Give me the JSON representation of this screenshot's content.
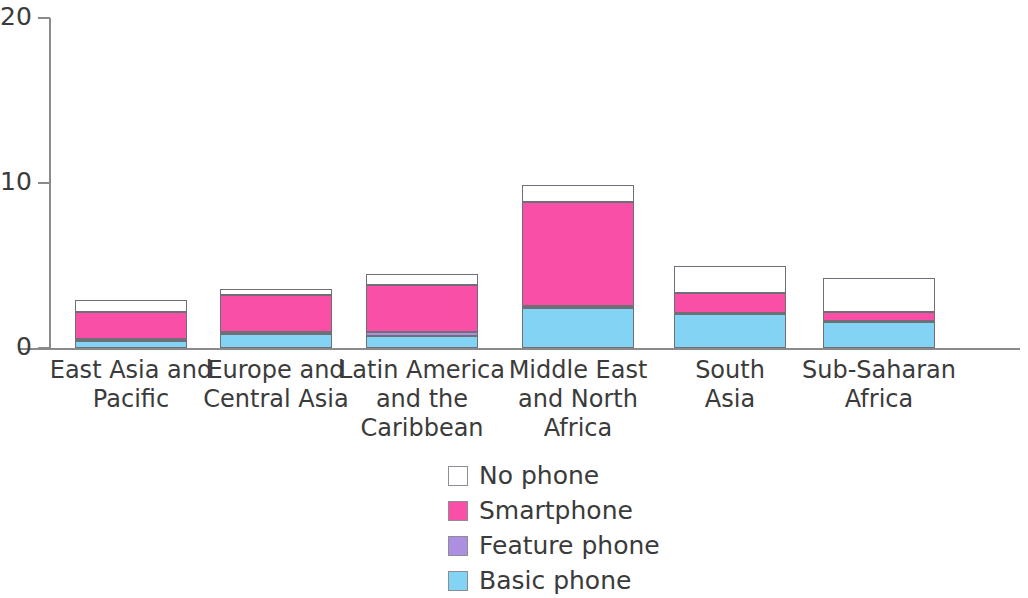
{
  "chart_data": {
    "type": "bar",
    "subtype": "stacked-bar",
    "title": "",
    "subtitle": "",
    "xlabel": "",
    "ylabel": "",
    "ylim": [
      0,
      20
    ],
    "ytick_labels": [
      "0",
      "10",
      "20"
    ],
    "ytick_values": [
      0,
      10,
      20
    ],
    "grid": false,
    "legend_position": "bottom-center",
    "categories": [
      "East Asia and\nPacific",
      "Europe and\nCentral Asia",
      "Latin America\nand the\nCaribbean",
      "Middle East\nand North\nAfrica",
      "South\nAsia",
      "Sub-Saharan\nAfrica"
    ],
    "stack_order_bottom_to_top": [
      "Basic phone",
      "Feature phone",
      "Smartphone",
      "No phone"
    ],
    "series": [
      {
        "name": "Basic phone",
        "color": "#82d3f4",
        "values": [
          0.45,
          0.85,
          0.75,
          2.4,
          2.05,
          1.6
        ]
      },
      {
        "name": "Feature phone",
        "color": "#ac8fe0",
        "values": [
          0.1,
          0.1,
          0.2,
          0.15,
          0.05,
          0.05
        ]
      },
      {
        "name": "Smartphone",
        "color": "#f94fa6",
        "values": [
          1.65,
          2.25,
          2.85,
          6.3,
          1.25,
          0.55
        ]
      },
      {
        "name": "No phone",
        "color": "#ffffff",
        "values": [
          0.7,
          0.4,
          0.7,
          1.05,
          1.65,
          2.05
        ]
      }
    ],
    "totals": [
      2.9,
      3.6,
      4.5,
      9.9,
      5.0,
      4.25
    ]
  },
  "axis": {
    "y_ticks": [
      {
        "label": "20",
        "value": 20
      },
      {
        "label": "10",
        "value": 10
      },
      {
        "label": "0",
        "value": 0
      }
    ]
  },
  "legend": {
    "items": [
      {
        "label": "No phone",
        "color": "#ffffff"
      },
      {
        "label": "Smartphone",
        "color": "#f94fa6"
      },
      {
        "label": "Feature phone",
        "color": "#ac8fe0"
      },
      {
        "label": "Basic phone",
        "color": "#82d3f4"
      }
    ]
  }
}
